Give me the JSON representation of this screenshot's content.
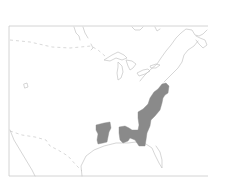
{
  "map": {
    "type": "range-map",
    "region": "Eastern United States",
    "colors": {
      "background": "#ffffff",
      "outline": "#c4c4c4",
      "range_fill": "#8a8a8a"
    },
    "legend": [],
    "labels": [],
    "range": {
      "description": "Shaded distribution area",
      "areas": [
        "Atlantic coastal states",
        "Southeast",
        "Gulf region",
        "Lower Mississippi valley"
      ]
    }
  }
}
